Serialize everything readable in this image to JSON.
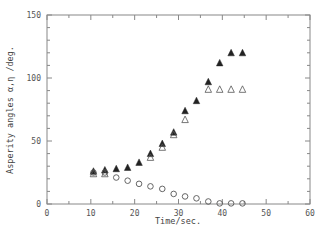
{
  "chart_data": {
    "type": "scatter",
    "title": "",
    "xlabel": "Time/sec.",
    "ylabel": "Asperity angles α,η /deg.",
    "xlim": [
      0,
      60
    ],
    "ylim": [
      0,
      150
    ],
    "xticks": [
      0,
      10,
      20,
      30,
      40,
      50,
      60
    ],
    "yticks": [
      0,
      50,
      100,
      150
    ],
    "x_minor_step": 5,
    "y_minor_step": 10,
    "grid": false,
    "legend": null,
    "series": [
      {
        "name": "filled triangles",
        "marker": "filled-triangle",
        "color": "#222222",
        "x": [
          10.6,
          13.2,
          15.8,
          18.4,
          21.0,
          23.6,
          26.3,
          28.9,
          31.5,
          34.1,
          36.8,
          39.4,
          42.0,
          44.6
        ],
        "y": [
          26,
          27,
          28,
          29,
          33,
          40,
          48,
          57,
          74,
          82,
          97,
          112,
          120,
          120
        ]
      },
      {
        "name": "open triangles",
        "marker": "open-triangle",
        "color": "#555555",
        "x": [
          10.6,
          13.2,
          23.6,
          26.3,
          28.9,
          31.5,
          36.8,
          39.4,
          42.0,
          44.6
        ],
        "y": [
          24,
          24,
          37,
          45,
          55,
          67,
          91,
          91,
          91,
          91
        ]
      },
      {
        "name": "open circles",
        "marker": "open-circle",
        "color": "#555555",
        "x": [
          10.6,
          13.2,
          15.8,
          18.4,
          21.0,
          23.6,
          26.3,
          28.9,
          31.5,
          34.1,
          36.8,
          39.4,
          42.0,
          44.6
        ],
        "y": [
          25,
          25,
          21,
          18.5,
          16,
          14,
          12,
          8,
          6,
          4.5,
          2,
          0.5,
          0.5,
          0.5
        ]
      }
    ]
  }
}
